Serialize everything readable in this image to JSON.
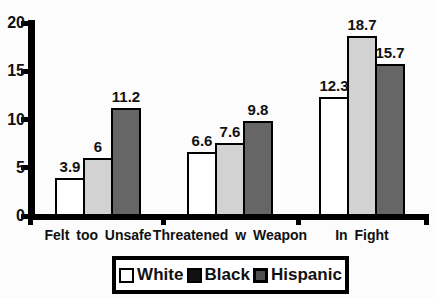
{
  "figure": {
    "background_color": "#fcfcfc",
    "axis_color": "#000000",
    "text_color": "#111111"
  },
  "chart_data": {
    "type": "bar",
    "title": "",
    "xlabel": "",
    "ylabel": "",
    "categories": [
      "Felt too Unsafe",
      "Threatened w Weapon",
      "In Fight"
    ],
    "series": [
      {
        "name": "White",
        "values": [
          3.9,
          6.6,
          12.3
        ],
        "bar_color": "#ffffff",
        "legend_swatch_color": "#ffffff"
      },
      {
        "name": "Black",
        "values": [
          6,
          7.6,
          18.7
        ],
        "bar_color": "#d2d2d2",
        "legend_swatch_color": "#111111"
      },
      {
        "name": "Hispanic",
        "values": [
          11.2,
          9.8,
          15.7
        ],
        "bar_color": "#666666",
        "legend_swatch_color": "#4f4f4f"
      }
    ],
    "value_labels": [
      [
        "3.9",
        "6",
        "11.2"
      ],
      [
        "6.6",
        "7.6",
        "9.8"
      ],
      [
        "12.3",
        "18.7",
        "15.7"
      ]
    ],
    "ylim": [
      0,
      20
    ],
    "yticks": [
      0,
      5,
      10,
      15,
      20
    ],
    "grid": false,
    "legend_position": "bottom",
    "legend_labels": [
      "White",
      "Black",
      "Hispanic"
    ]
  }
}
